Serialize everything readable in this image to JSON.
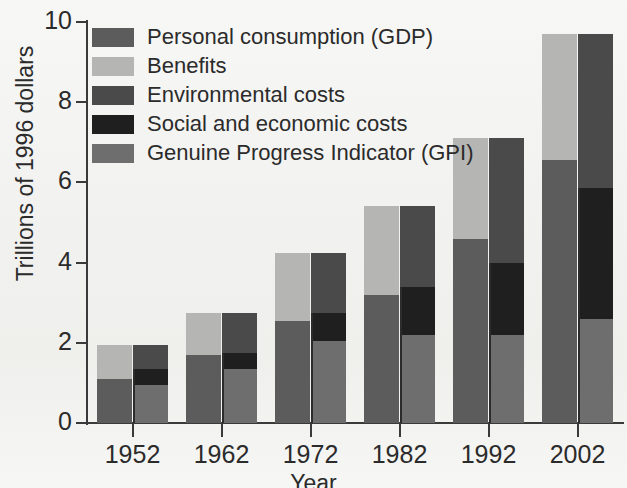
{
  "chart_data": {
    "type": "bar",
    "title": "",
    "subtitle": "",
    "xlabel": "Year",
    "ylabel": "Trillions of 1996 dollars",
    "categories": [
      "1952",
      "1962",
      "1972",
      "1982",
      "1992",
      "2002"
    ],
    "ylim": [
      0,
      10
    ],
    "yticks": [
      "0",
      "2",
      "4",
      "6",
      "8",
      "10"
    ],
    "ytick_values": [
      0,
      2,
      4,
      6,
      8,
      10
    ],
    "grid": false,
    "legend_position": "top-left",
    "note": "Each year shows two adjacent stacked bars: left bar = GDP (personal consumption + benefits); right bar = same total decomposed into genuine progress indicator, social and economic costs, environmental costs.",
    "legend": [
      {
        "label": "Personal consumption (GDP)",
        "color": "#5c5c5c"
      },
      {
        "label": "Benefits",
        "color": "#b5b5b3"
      },
      {
        "label": "Environmental costs",
        "color": "#4a4a4a"
      },
      {
        "label": "Social and economic costs",
        "color": "#1f1f1f"
      },
      {
        "label": "Genuine Progress Indicator (GPI)",
        "color": "#6e6e6e"
      }
    ],
    "series": [
      {
        "name": "Personal consumption (GDP)",
        "bar": "left",
        "color": "#5c5c5c",
        "values": [
          1.1,
          1.7,
          2.55,
          3.2,
          4.6,
          6.55
        ]
      },
      {
        "name": "Benefits",
        "bar": "left",
        "color": "#b5b5b3",
        "values": [
          0.85,
          1.05,
          1.7,
          2.2,
          2.5,
          3.15
        ]
      },
      {
        "name": "Genuine Progress Indicator (GPI)",
        "bar": "right",
        "color": "#6e6e6e",
        "values": [
          0.95,
          1.35,
          2.05,
          2.2,
          2.2,
          2.6
        ]
      },
      {
        "name": "Social and economic costs",
        "bar": "right",
        "color": "#1f1f1f",
        "values": [
          0.4,
          0.4,
          0.7,
          1.2,
          1.8,
          3.25
        ]
      },
      {
        "name": "Environmental costs",
        "bar": "right",
        "color": "#4a4a4a",
        "values": [
          0.6,
          1.0,
          1.5,
          2.0,
          3.1,
          3.85
        ]
      }
    ],
    "totals": [
      1.95,
      2.75,
      4.25,
      5.4,
      7.1,
      9.7
    ]
  }
}
